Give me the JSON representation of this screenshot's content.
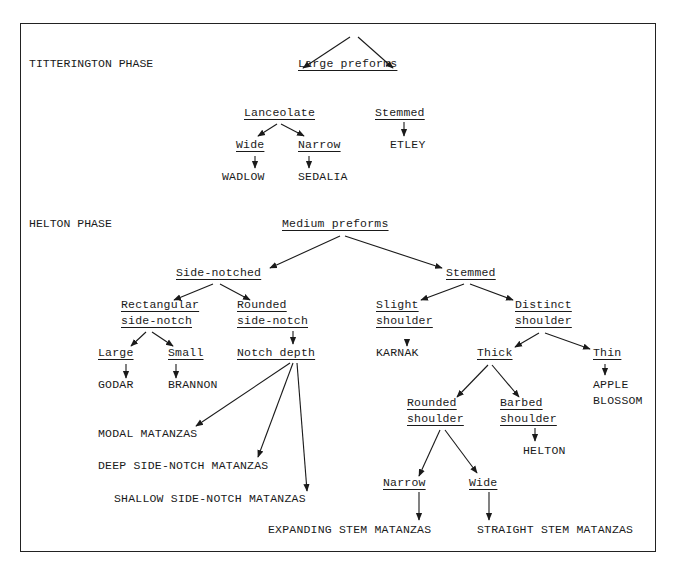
{
  "diagram": {
    "type": "classification-tree",
    "phases": [
      {
        "name": "TITTERINGTON PHASE",
        "root": "Large preforms",
        "tree": {
          "Large preforms": [
            "Lanceolate",
            "Stemmed"
          ],
          "Lanceolate": [
            "Wide",
            "Narrow"
          ],
          "Wide": [
            "WADLOW"
          ],
          "Narrow": [
            "SEDALIA"
          ],
          "Stemmed": [
            "ETLEY"
          ]
        }
      },
      {
        "name": "HELTON PHASE",
        "root": "Medium preforms",
        "tree": {
          "Medium preforms": [
            "Side-notched",
            "Stemmed"
          ],
          "Side-notched": [
            "Rectangular side-notch",
            "Rounded side-notch"
          ],
          "Rectangular side-notch": [
            "Large",
            "Small"
          ],
          "Large": [
            "GODAR"
          ],
          "Small": [
            "BRANNON"
          ],
          "Rounded side-notch": [
            "Notch depth"
          ],
          "Notch depth": [
            "MODAL MATANZAS",
            "DEEP SIDE-NOTCH MATANZAS",
            "SHALLOW SIDE-NOTCH MATANZAS"
          ],
          "Stemmed": [
            "Slight shoulder",
            "Distinct shoulder"
          ],
          "Slight shoulder": [
            "KARNAK"
          ],
          "Distinct shoulder": [
            "Thick",
            "Thin"
          ],
          "Thin": [
            "APPLE BLOSSOM"
          ],
          "Thick": [
            "Rounded shoulder",
            "Barbed shoulder"
          ],
          "Barbed shoulder": [
            "HELTON"
          ],
          "Rounded shoulder": [
            "Narrow",
            "Wide"
          ],
          "Narrow": [
            "EXPANDING STEM MATANZAS"
          ],
          "Wide": [
            "STRAIGHT STEM MATANZAS"
          ]
        }
      }
    ]
  },
  "labels": {
    "titt_phase": "TITTERINGTON PHASE",
    "large_preforms": "Large preforms",
    "lanceolate": "Lanceolate",
    "stemmed1": "Stemmed",
    "wide1": "Wide",
    "narrow1": "Narrow",
    "wadlow": "WADLOW",
    "sedalia": "SEDALIA",
    "etley": "ETLEY",
    "helton_phase": "HELTON PHASE",
    "medium_preforms": "Medium preforms",
    "side_notched": "Side-notched",
    "stemmed2": "Stemmed",
    "rect_1": "Rectangular",
    "rect_2": "side-notch",
    "round_1": "Rounded",
    "round_2": "side-notch",
    "slight_1": "Slight",
    "slight_2": "shoulder",
    "distinct_1": "Distinct",
    "distinct_2": "shoulder",
    "large2": "Large",
    "small": "Small",
    "notch_depth": "Notch depth",
    "godar": "GODAR",
    "brannon": "BRANNON",
    "karnak": "KARNAK",
    "thick": "Thick",
    "thin": "Thin",
    "apple_1": "APPLE",
    "apple_2": "BLOSSOM",
    "rshoulder_1": "Rounded",
    "rshoulder_2": "shoulder",
    "bshoulder_1": "Barbed",
    "bshoulder_2": "shoulder",
    "helton": "HELTON",
    "modal": "MODAL MATANZAS",
    "deep": "DEEP SIDE-NOTCH MATANZAS",
    "shallow": "SHALLOW SIDE-NOTCH MATANZAS",
    "narrow2": "Narrow",
    "wide2": "Wide",
    "expanding": "EXPANDING STEM MATANZAS",
    "straight": "STRAIGHT STEM MATANZAS"
  }
}
